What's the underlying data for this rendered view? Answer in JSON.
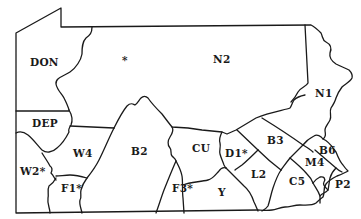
{
  "map": {
    "subject": "Pennsylvania regional districts",
    "regions": [
      {
        "id": "DON",
        "label": "DON",
        "x": 30,
        "y": 65
      },
      {
        "id": "N2",
        "label": "N2",
        "x": 215,
        "y": 62
      },
      {
        "id": "N1",
        "label": "N1",
        "x": 316,
        "y": 96
      },
      {
        "id": "DEP",
        "label": "DEP",
        "x": 32,
        "y": 127
      },
      {
        "id": "W4",
        "label": "W4",
        "x": 72,
        "y": 156
      },
      {
        "id": "W2",
        "label": "W2*",
        "x": 20,
        "y": 174
      },
      {
        "id": "F1",
        "label": "F1*",
        "x": 62,
        "y": 190
      },
      {
        "id": "B2",
        "label": "B2",
        "x": 132,
        "y": 154
      },
      {
        "id": "CU",
        "label": "CU",
        "x": 192,
        "y": 150
      },
      {
        "id": "F3",
        "label": "F3*",
        "x": 171,
        "y": 191
      },
      {
        "id": "D1",
        "label": "D1*",
        "x": 222,
        "y": 156
      },
      {
        "id": "B3",
        "label": "B3",
        "x": 264,
        "y": 143
      },
      {
        "id": "B6",
        "label": "B6",
        "x": 319,
        "y": 153
      },
      {
        "id": "M4",
        "label": "M4",
        "x": 305,
        "y": 165
      },
      {
        "id": "L2",
        "label": "L2",
        "x": 250,
        "y": 177
      },
      {
        "id": "C5",
        "label": "C5",
        "x": 288,
        "y": 185
      },
      {
        "id": "P2",
        "label": "P2",
        "x": 336,
        "y": 188
      },
      {
        "id": "Y",
        "label": "Y",
        "x": 218,
        "y": 195
      }
    ],
    "markers": [
      {
        "name": "star-marker",
        "symbol": "*",
        "x": 125,
        "y": 62
      }
    ]
  }
}
